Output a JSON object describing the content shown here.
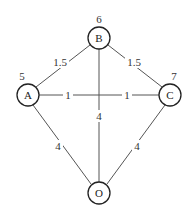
{
  "graph": {
    "nodes": [
      {
        "id": "A",
        "label": "A",
        "value": "5",
        "cx": 28,
        "cy": 95
      },
      {
        "id": "B",
        "label": "B",
        "value": "6",
        "cx": 99,
        "cy": 38
      },
      {
        "id": "C",
        "label": "C",
        "value": "7",
        "cx": 170,
        "cy": 95
      },
      {
        "id": "O",
        "label": "O",
        "value": "",
        "cx": 99,
        "cy": 193
      }
    ],
    "edges": [
      {
        "from": "A",
        "to": "B",
        "weight": "1.5"
      },
      {
        "from": "B",
        "to": "C",
        "weight": "1.5"
      },
      {
        "from": "A",
        "to": "C",
        "weight": "1",
        "weight_second": "1"
      },
      {
        "from": "B",
        "to": "O",
        "weight": "4"
      },
      {
        "from": "A",
        "to": "O",
        "weight": "4"
      },
      {
        "from": "C",
        "to": "O",
        "weight": "4"
      }
    ]
  }
}
